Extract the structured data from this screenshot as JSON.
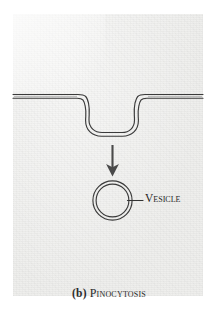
{
  "figure": {
    "panel_label_letter": "(b)",
    "panel_label_text": "Pinocytosis",
    "annotations": [
      {
        "name": "vesicle",
        "label": "Vesicle"
      }
    ],
    "colors": {
      "panel_fill": "#eeeeec",
      "page_background": "#ffffff",
      "line_stroke": "#3a3a3a",
      "text": "#2b2b2b"
    },
    "elements": {
      "membrane_label": "plasma-membrane",
      "invagination_label": "membrane-invagination",
      "arrow_label": "downward-process-arrow",
      "vesicle_label": "vesicle-circle",
      "leader_label": "vesicle-leader-line"
    }
  }
}
